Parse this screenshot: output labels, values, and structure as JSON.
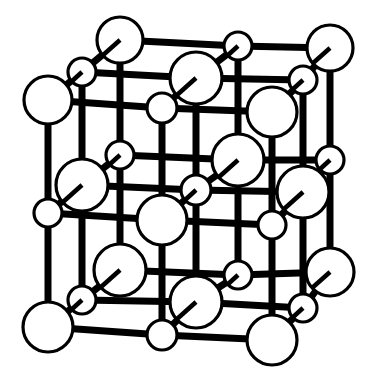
{
  "figure": {
    "name": "rock-salt-crystal-lattice",
    "background_color": "#ffffff",
    "ink_color": "#000000",
    "sphere_fill": "#ffffff",
    "stroke_color": "#000000",
    "bond_width": 7,
    "sphere_outline_width": 3.2,
    "stub_width": 4.5,
    "canvas": {
      "width": 377,
      "height": 392
    }
  },
  "legend": {
    "large_sphere_label": "large ion",
    "small_sphere_label": "small ion",
    "bond_label": "bond"
  },
  "geometry": {
    "bond_color": "#000000",
    "bonds": [
      [
        120,
        40,
        238,
        46
      ],
      [
        238,
        46,
        330,
        48
      ],
      [
        120,
        40,
        82,
        72
      ],
      [
        238,
        46,
        196,
        78
      ],
      [
        330,
        48,
        303,
        80
      ],
      [
        82,
        72,
        196,
        78
      ],
      [
        196,
        78,
        303,
        80
      ],
      [
        82,
        72,
        48,
        100
      ],
      [
        196,
        78,
        162,
        108
      ],
      [
        303,
        80,
        272,
        112
      ],
      [
        48,
        100,
        162,
        108
      ],
      [
        162,
        108,
        272,
        112
      ],
      [
        120,
        40,
        120,
        155
      ],
      [
        238,
        46,
        238,
        160
      ],
      [
        330,
        48,
        330,
        160
      ],
      [
        82,
        72,
        82,
        185
      ],
      [
        196,
        78,
        196,
        190
      ],
      [
        303,
        80,
        303,
        192
      ],
      [
        48,
        100,
        48,
        213
      ],
      [
        162,
        108,
        162,
        220
      ],
      [
        272,
        112,
        272,
        225
      ],
      [
        120,
        155,
        238,
        160
      ],
      [
        238,
        160,
        330,
        160
      ],
      [
        120,
        155,
        82,
        185
      ],
      [
        238,
        160,
        196,
        190
      ],
      [
        330,
        160,
        303,
        192
      ],
      [
        82,
        185,
        196,
        190
      ],
      [
        196,
        190,
        303,
        192
      ],
      [
        82,
        185,
        48,
        213
      ],
      [
        196,
        190,
        162,
        220
      ],
      [
        303,
        192,
        272,
        225
      ],
      [
        48,
        213,
        162,
        220
      ],
      [
        162,
        220,
        272,
        225
      ],
      [
        120,
        155,
        120,
        270
      ],
      [
        238,
        160,
        238,
        275
      ],
      [
        330,
        160,
        330,
        272
      ],
      [
        82,
        185,
        82,
        300
      ],
      [
        196,
        190,
        196,
        302
      ],
      [
        303,
        192,
        303,
        308
      ],
      [
        48,
        213,
        48,
        327
      ],
      [
        162,
        220,
        162,
        335
      ],
      [
        272,
        225,
        272,
        340
      ],
      [
        120,
        270,
        238,
        275
      ],
      [
        238,
        275,
        330,
        272
      ],
      [
        120,
        270,
        82,
        300
      ],
      [
        238,
        275,
        196,
        302
      ],
      [
        330,
        272,
        303,
        308
      ],
      [
        82,
        300,
        196,
        302
      ],
      [
        196,
        302,
        303,
        308
      ],
      [
        82,
        300,
        48,
        327
      ],
      [
        196,
        302,
        162,
        335
      ],
      [
        303,
        308,
        272,
        340
      ],
      [
        48,
        327,
        162,
        335
      ],
      [
        162,
        335,
        272,
        340
      ]
    ],
    "spheres": [
      {
        "id": "L-back-top-left",
        "cx": 120,
        "cy": 40,
        "r": 23,
        "size": "large",
        "stub": [
          -18,
          16
        ]
      },
      {
        "id": "S-top-mid-back",
        "cx": 238,
        "cy": 46,
        "r": 14,
        "size": "small",
        "stub": [
          -11,
          10
        ]
      },
      {
        "id": "L-back-top-right",
        "cx": 330,
        "cy": 48,
        "r": 23,
        "size": "large",
        "stub": [
          -18,
          16
        ]
      },
      {
        "id": "S-top-left-front",
        "cx": 82,
        "cy": 72,
        "r": 14,
        "size": "small",
        "stub": [
          -11,
          10
        ]
      },
      {
        "id": "L-top-mid",
        "cx": 196,
        "cy": 78,
        "r": 26,
        "size": "large",
        "stub": [
          -19,
          17
        ]
      },
      {
        "id": "S-top-right",
        "cx": 303,
        "cy": 80,
        "r": 14,
        "size": "small",
        "stub": [
          -11,
          10
        ]
      },
      {
        "id": "L-left-upper",
        "cx": 48,
        "cy": 100,
        "r": 24,
        "size": "large",
        "stub": [
          0,
          0
        ]
      },
      {
        "id": "S-mid-upper-left",
        "cx": 162,
        "cy": 108,
        "r": 15,
        "size": "small",
        "stub": [
          0,
          0
        ]
      },
      {
        "id": "L-upper-right-in",
        "cx": 272,
        "cy": 112,
        "r": 25,
        "size": "large",
        "stub": [
          0,
          0
        ]
      },
      {
        "id": "S-mid-left-2",
        "cx": 120,
        "cy": 155,
        "r": 14,
        "size": "small",
        "stub": [
          -11,
          10
        ]
      },
      {
        "id": "L-center-upper",
        "cx": 238,
        "cy": 160,
        "r": 26,
        "size": "large",
        "stub": [
          -19,
          17
        ]
      },
      {
        "id": "S-right-mid",
        "cx": 330,
        "cy": 160,
        "r": 14,
        "size": "small",
        "stub": [
          -11,
          10
        ]
      },
      {
        "id": "L-left-mid",
        "cx": 82,
        "cy": 185,
        "r": 26,
        "size": "large",
        "stub": [
          -19,
          17
        ]
      },
      {
        "id": "S-center",
        "cx": 196,
        "cy": 190,
        "r": 15,
        "size": "small",
        "stub": [
          -12,
          11
        ]
      },
      {
        "id": "L-right-mid",
        "cx": 303,
        "cy": 192,
        "r": 26,
        "size": "large",
        "stub": [
          -19,
          17
        ]
      },
      {
        "id": "S-left-lower",
        "cx": 48,
        "cy": 213,
        "r": 14,
        "size": "small",
        "stub": [
          0,
          0
        ]
      },
      {
        "id": "L-center",
        "cx": 162,
        "cy": 220,
        "r": 25,
        "size": "large",
        "stub": [
          0,
          0
        ]
      },
      {
        "id": "S-right-lower",
        "cx": 272,
        "cy": 225,
        "r": 14,
        "size": "small",
        "stub": [
          0,
          0
        ]
      },
      {
        "id": "L-front-low-left",
        "cx": 120,
        "cy": 270,
        "r": 26,
        "size": "large",
        "stub": [
          -19,
          17
        ]
      },
      {
        "id": "S-bottom-mid",
        "cx": 238,
        "cy": 275,
        "r": 14,
        "size": "small",
        "stub": [
          -11,
          10
        ]
      },
      {
        "id": "L-low-right",
        "cx": 330,
        "cy": 272,
        "r": 24,
        "size": "large",
        "stub": [
          -18,
          16
        ]
      },
      {
        "id": "S-bottom-left",
        "cx": 82,
        "cy": 300,
        "r": 14,
        "size": "small",
        "stub": [
          -11,
          10
        ]
      },
      {
        "id": "L-bottom-mid",
        "cx": 196,
        "cy": 302,
        "r": 26,
        "size": "large",
        "stub": [
          -19,
          17
        ]
      },
      {
        "id": "S-bottom-right",
        "cx": 303,
        "cy": 308,
        "r": 14,
        "size": "small",
        "stub": [
          -11,
          10
        ]
      },
      {
        "id": "L-front-bot-left",
        "cx": 48,
        "cy": 327,
        "r": 25,
        "size": "large",
        "stub": [
          0,
          0
        ]
      },
      {
        "id": "S-front-bot-mid",
        "cx": 162,
        "cy": 335,
        "r": 15,
        "size": "small",
        "stub": [
          0,
          0
        ]
      },
      {
        "id": "L-front-bot-right",
        "cx": 272,
        "cy": 340,
        "r": 25,
        "size": "large",
        "stub": [
          0,
          0
        ]
      }
    ]
  }
}
